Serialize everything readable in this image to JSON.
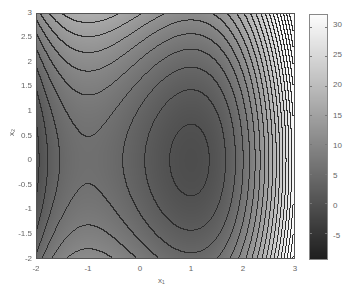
{
  "chart_data": {
    "type": "contour",
    "title": "",
    "xlabel": "x₁",
    "ylabel": "x₂",
    "xlim": [
      -2,
      3
    ],
    "ylim": [
      -2,
      3
    ],
    "xticks": [
      "-2",
      "-1",
      "0",
      "1",
      "2",
      "3"
    ],
    "yticks": [
      "3",
      "2.5",
      "2",
      "1.5",
      "1",
      "0.5",
      "0",
      "-0.5",
      "-1",
      "-1.5",
      "-2"
    ],
    "colorbar": {
      "ticks": [
        "30",
        "25",
        "20",
        "15",
        "10",
        "5",
        "0",
        "-5"
      ],
      "range": [
        -9.5,
        32
      ],
      "colormap": "gray"
    },
    "features": {
      "saddle_point": [
        -1,
        0
      ],
      "minimum": [
        1,
        0
      ]
    },
    "function_hint": "f(x1,x2) ~ x1^3 - 3*x1 + x2^2 (scaled)",
    "grid": false,
    "legend": "colorbar right"
  }
}
